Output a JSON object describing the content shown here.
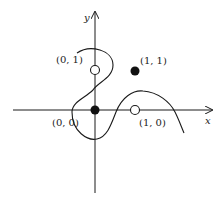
{
  "diagram": {
    "type": "coordinate-plot",
    "axes": {
      "x_label": "x",
      "y_label": "y"
    },
    "points": [
      {
        "label": "(0, 1)",
        "x": 0,
        "y": 1,
        "style": "open"
      },
      {
        "label": "(1, 1)",
        "x": 1,
        "y": 1,
        "style": "filled"
      },
      {
        "label": "(0, 0)",
        "x": 0,
        "y": 0,
        "style": "filled"
      },
      {
        "label": "(1, 0)",
        "x": 1,
        "y": 0,
        "style": "open"
      }
    ],
    "curve": "smooth S-shaped curve looping left around (0,1), passing through (0,0), rising to a peak right of (1,0), then descending below the x-axis"
  },
  "colors": {
    "stroke": "#1a1a1a",
    "background": "#ffffff"
  }
}
